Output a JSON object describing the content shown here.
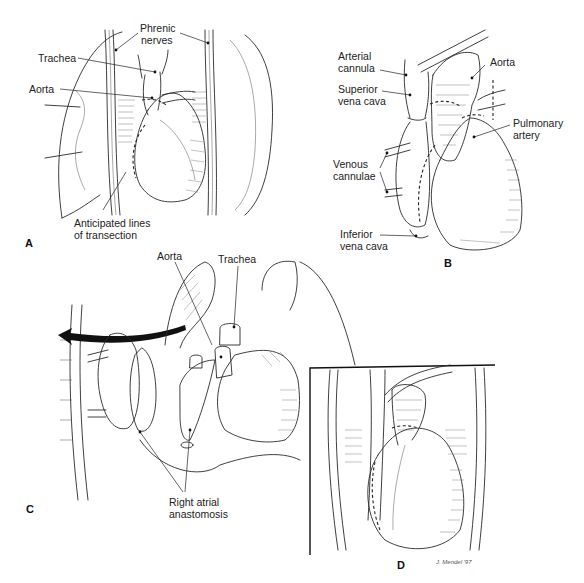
{
  "figure": {
    "panels": [
      {
        "id": "A",
        "letter": "A",
        "labels": {
          "phrenic_nerves_1": "Phrenic",
          "phrenic_nerves_2": "nerves",
          "trachea": "Trachea",
          "aorta": "Aorta",
          "transection_1": "Anticipated lines",
          "transection_2": "of transection"
        }
      },
      {
        "id": "B",
        "letter": "B",
        "labels": {
          "arterial_cannula_1": "Arterial",
          "arterial_cannula_2": "cannula",
          "svc_1": "Superior",
          "svc_2": "vena cava",
          "aorta": "Aorta",
          "pulmonary_artery_1": "Pulmonary",
          "pulmonary_artery_2": "artery",
          "venous_cannulae_1": "Venous",
          "venous_cannulae_2": "cannulae",
          "ivc_1": "Inferior",
          "ivc_2": "vena cava"
        }
      },
      {
        "id": "C",
        "letter": "C",
        "labels": {
          "aorta": "Aorta",
          "trachea": "Trachea",
          "ra_anastomosis_1": "Right atrial",
          "ra_anastomosis_2": "anastomosis"
        }
      },
      {
        "id": "D",
        "letter": "D",
        "labels": {}
      }
    ],
    "signature": "J. Mendel '97"
  }
}
